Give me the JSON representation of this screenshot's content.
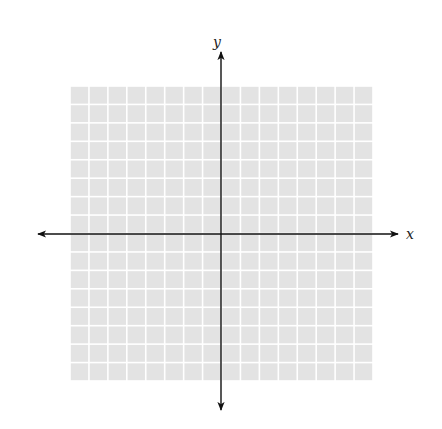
{
  "diagram": {
    "type": "coordinate-plane",
    "grid": {
      "columns": 16,
      "rows": 16,
      "left": 70,
      "top": 86,
      "right": 373,
      "bottom": 381,
      "fill_color": "#e3e3e3",
      "line_color": "#ffffff"
    },
    "axes": {
      "origin": {
        "x": 221,
        "y": 234
      },
      "color": "#111111",
      "x_axis": {
        "label": "x",
        "start": 38,
        "end": 398
      },
      "y_axis": {
        "label": "y",
        "start": 52,
        "end": 410
      }
    }
  }
}
